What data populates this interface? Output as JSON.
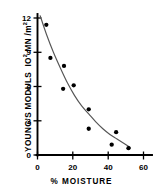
{
  "chart_data": {
    "type": "scatter",
    "title": "",
    "xlabel": "% MOISTURE",
    "ylabel": "YOUNG'S MODULS  10² MN/m²",
    "ylabel_main": "YOUNG'S MODULS",
    "ylabel_units_base": "IO",
    "ylabel_units_exp": "2",
    "ylabel_units_rest": " MN /m",
    "ylabel_units_rest_exp": "2",
    "xlim": [
      0,
      65
    ],
    "ylim": [
      0,
      12.6
    ],
    "xticks": [
      0,
      20,
      40,
      60
    ],
    "xticklabels": [
      "0",
      "20",
      "40",
      "60"
    ],
    "yticks": [
      0,
      3,
      6,
      9,
      12
    ],
    "yticklabels": [
      "0",
      "3",
      "6",
      "9",
      "12"
    ],
    "grid": false,
    "legend": null,
    "marker": "filled-circle",
    "marker_color": "#000000",
    "line_color": "#555555",
    "axis_color": "#000000",
    "points": [
      {
        "x": 5.0,
        "y": 11.4
      },
      {
        "x": 7.3,
        "y": 8.5
      },
      {
        "x": 15.0,
        "y": 7.8
      },
      {
        "x": 14.5,
        "y": 5.8
      },
      {
        "x": 20.5,
        "y": 6.1
      },
      {
        "x": 29.0,
        "y": 4.0
      },
      {
        "x": 29.0,
        "y": 2.3
      },
      {
        "x": 42.0,
        "y": 0.9
      },
      {
        "x": 44.5,
        "y": 2.0
      },
      {
        "x": 51.5,
        "y": 0.6
      }
    ],
    "fit_curve": [
      {
        "x": 1.5,
        "y": 12.2
      },
      {
        "x": 5.0,
        "y": 10.6
      },
      {
        "x": 9.0,
        "y": 9.0
      },
      {
        "x": 13.0,
        "y": 7.6
      },
      {
        "x": 17.0,
        "y": 6.3
      },
      {
        "x": 21.0,
        "y": 5.2
      },
      {
        "x": 25.0,
        "y": 4.3
      },
      {
        "x": 29.0,
        "y": 3.6
      },
      {
        "x": 33.0,
        "y": 2.9
      },
      {
        "x": 37.0,
        "y": 2.3
      },
      {
        "x": 41.0,
        "y": 1.8
      },
      {
        "x": 45.0,
        "y": 1.4
      },
      {
        "x": 49.0,
        "y": 1.0
      },
      {
        "x": 52.5,
        "y": 0.65
      }
    ]
  },
  "axes": {
    "x_title": "% MOISTURE",
    "y_title_main": "YOUNG'S MODULS",
    "y_units_prefix": "IO",
    "y_units_exp1": "2",
    "y_units_mid": " MN /m",
    "y_units_exp2": "2"
  },
  "ticks": {
    "x": [
      "0",
      "20",
      "40",
      "60"
    ],
    "y": [
      "0",
      "3",
      "6",
      "9",
      "12"
    ]
  }
}
